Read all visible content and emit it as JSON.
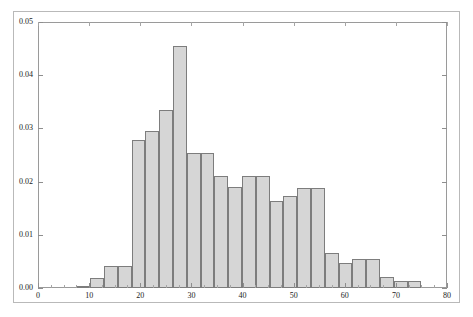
{
  "chart_data": {
    "type": "bar",
    "title": "",
    "subtitle": "",
    "xlabel": "",
    "ylabel": "",
    "grid": false,
    "legend": "none",
    "xlim": [
      0,
      80
    ],
    "ylim": [
      0.0,
      0.05
    ],
    "xticks": [
      0,
      10,
      20,
      30,
      40,
      50,
      60,
      70,
      80
    ],
    "xtick_labels": [
      "0",
      "10",
      "20",
      "30",
      "40",
      "50",
      "60",
      "70",
      "80"
    ],
    "yticks": [
      0.0,
      0.01,
      0.02,
      0.03,
      0.04,
      0.05
    ],
    "ytick_labels": [
      "0.00",
      "0.01",
      "0.02",
      "0.03",
      "0.04",
      "0.05"
    ],
    "bin_width": 2.7,
    "bin_edges": [
      7.5,
      10.2,
      12.9,
      15.6,
      18.3,
      21.0,
      23.7,
      26.4,
      29.1,
      31.8,
      34.5,
      37.2,
      39.9,
      42.6,
      45.3,
      48.0,
      50.7,
      53.4,
      56.1,
      58.8,
      61.5,
      64.2,
      66.9,
      69.6,
      72.3
    ],
    "categories": [
      "7.5-10.2",
      "10.2-12.9",
      "12.9-15.6",
      "15.6-18.3",
      "18.3-21.0",
      "21.0-23.7",
      "23.7-26.4",
      "26.4-29.1",
      "29.1-31.8",
      "31.8-34.5",
      "34.5-37.2",
      "37.2-39.9",
      "39.9-42.6",
      "42.6-45.3",
      "45.3-48.0",
      "48.0-50.7",
      "50.7-53.4",
      "53.4-56.1",
      "56.1-58.8",
      "58.8-61.5",
      "61.5-64.2",
      "64.2-66.9",
      "66.9-69.6",
      "69.6-72.3"
    ],
    "values": [
      0.0004,
      0.0013,
      0.0013,
      0.0026,
      0.0279,
      0.0295,
      0.0335,
      0.0455,
      0.0254,
      0.0254,
      0.021,
      0.0189,
      0.021,
      0.021,
      0.0164,
      0.0173,
      0.0188,
      0.0188,
      0.0066,
      0.0047,
      0.0054,
      0.0054,
      0.0014,
      0.001
    ]
  },
  "bars": [
    {
      "x0": 7.5,
      "x1": 10.2,
      "value": 0.0004
    },
    {
      "x0": 10.2,
      "x1": 12.9,
      "value": 0.0018
    },
    {
      "x0": 12.9,
      "x1": 15.6,
      "value": 0.0041
    },
    {
      "x0": 15.6,
      "x1": 18.3,
      "value": 0.0041
    },
    {
      "x0": 18.3,
      "x1": 21.0,
      "value": 0.0279
    },
    {
      "x0": 21.0,
      "x1": 23.7,
      "value": 0.0295
    },
    {
      "x0": 23.7,
      "x1": 26.4,
      "value": 0.0335
    },
    {
      "x0": 26.4,
      "x1": 29.1,
      "value": 0.0455
    },
    {
      "x0": 29.1,
      "x1": 31.8,
      "value": 0.0254
    },
    {
      "x0": 31.8,
      "x1": 34.5,
      "value": 0.0254
    },
    {
      "x0": 34.5,
      "x1": 37.2,
      "value": 0.021
    },
    {
      "x0": 37.2,
      "x1": 39.9,
      "value": 0.0189
    },
    {
      "x0": 39.9,
      "x1": 42.6,
      "value": 0.021
    },
    {
      "x0": 42.6,
      "x1": 45.3,
      "value": 0.021
    },
    {
      "x0": 45.3,
      "x1": 48.0,
      "value": 0.0164
    },
    {
      "x0": 48.0,
      "x1": 50.7,
      "value": 0.0173
    },
    {
      "x0": 50.7,
      "x1": 53.4,
      "value": 0.0188
    },
    {
      "x0": 53.4,
      "x1": 56.1,
      "value": 0.0188
    },
    {
      "x0": 56.1,
      "x1": 58.8,
      "value": 0.0066
    },
    {
      "x0": 58.8,
      "x1": 61.5,
      "value": 0.0047
    },
    {
      "x0": 61.5,
      "x1": 64.2,
      "value": 0.0054
    },
    {
      "x0": 64.2,
      "x1": 66.9,
      "value": 0.0054
    },
    {
      "x0": 66.9,
      "x1": 69.6,
      "value": 0.002
    },
    {
      "x0": 69.6,
      "x1": 72.3,
      "value": 0.0013
    },
    {
      "x0": 72.3,
      "x1": 75.0,
      "value": 0.0013
    }
  ],
  "style": {
    "bar_fill": "#d6d6d6",
    "bar_border": "#7d7d7d",
    "axis_color": "#9a9a9a",
    "frame_color": "#b9b9b9",
    "text_color": "#1a1a1a",
    "background": "#ffffff"
  }
}
